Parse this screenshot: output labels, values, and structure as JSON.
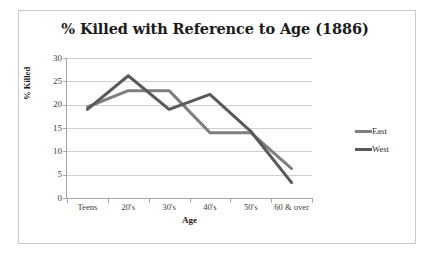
{
  "chart_data": {
    "type": "line",
    "title": "% Killed with Reference to Age (1886)",
    "xlabel": "Age",
    "ylabel": "% Killed",
    "categories": [
      "Teens",
      "20's",
      "30's",
      "40's",
      "50's",
      "60 & over"
    ],
    "ylim": [
      0,
      30
    ],
    "yticks": [
      0,
      5,
      10,
      15,
      20,
      25,
      30
    ],
    "ytick_labels": [
      "0",
      "5",
      "10",
      "15",
      "20",
      "25",
      "30"
    ],
    "grid": "horizontal",
    "legend_position": "right",
    "series": [
      {
        "name": "East",
        "color": "#7f7f7f",
        "values": [
          19.5,
          23.0,
          23.0,
          14.0,
          14.0,
          6.3
        ]
      },
      {
        "name": "West",
        "color": "#595959",
        "values": [
          19.0,
          26.2,
          19.0,
          22.2,
          14.3,
          3.3
        ]
      }
    ]
  },
  "figure": {
    "border_color": "#c9c9c9",
    "background": "#ffffff",
    "axis_color": "#a6a6a6",
    "gridline_color": "#d0d0d0"
  }
}
